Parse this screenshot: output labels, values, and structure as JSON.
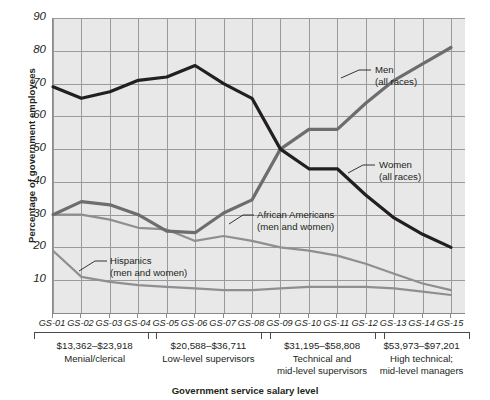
{
  "chart_data": {
    "type": "line",
    "title": "",
    "xlabel": "Government service salary level",
    "ylabel": "Percentage of government employees",
    "ylim": [
      0,
      90
    ],
    "yticks": [
      10,
      20,
      30,
      40,
      50,
      60,
      70,
      80,
      90
    ],
    "grid": true,
    "legend_position": "inline-annotations",
    "categories": [
      "GS-01",
      "GS-02",
      "GS-03",
      "GS-04",
      "GS-05",
      "GS-06",
      "GS-07",
      "GS-08",
      "GS-09",
      "GS-10",
      "GS-11",
      "GS-12",
      "GS-13",
      "GS-14",
      "GS-15"
    ],
    "series": [
      {
        "name": "Women (all races)",
        "color": "#231f20",
        "values": [
          69,
          65.5,
          67.5,
          71,
          72,
          75.5,
          70,
          65.5,
          50,
          44,
          44,
          36,
          29,
          24,
          20
        ]
      },
      {
        "name": "Men (all races)",
        "color": "#6d6d6d",
        "values": [
          30,
          34,
          33,
          30,
          25,
          24.5,
          30.5,
          34.5,
          50,
          56,
          56,
          64,
          71,
          76,
          81
        ]
      },
      {
        "name": "African Americans (men and women)",
        "color": "#8f8f8f",
        "values": [
          30,
          30,
          28.5,
          26,
          25.5,
          22,
          23.5,
          22,
          20,
          19,
          17.5,
          15,
          12,
          9,
          7
        ]
      },
      {
        "name": "Hispanics (men and women)",
        "color": "#8f8f8f",
        "values": [
          19,
          11,
          9.5,
          8.5,
          8,
          7.5,
          7,
          7,
          7.5,
          8,
          8,
          8,
          7.5,
          6.5,
          5.5
        ]
      }
    ],
    "annotations": [
      {
        "label_line1": "Men",
        "label_line2": "(all races)"
      },
      {
        "label_line1": "Women",
        "label_line2": "(all races)"
      },
      {
        "label_line1": "African Americans",
        "label_line2": "(men and women)"
      },
      {
        "label_line1": "Hispanics",
        "label_line2": "(men and women)"
      }
    ],
    "salary_groups": [
      {
        "range": "$13,362–$23,918",
        "role_line1": "Menial/clerical",
        "role_line2": "",
        "levels": [
          "GS-01",
          "GS-02",
          "GS-03",
          "GS-04"
        ]
      },
      {
        "range": "$20,588–$36,711",
        "role_line1": "Low-level supervisors",
        "role_line2": "",
        "levels": [
          "GS-05",
          "GS-06",
          "GS-07",
          "GS-08"
        ]
      },
      {
        "range": "$31,195–$58,808",
        "role_line1": "Technical and",
        "role_line2": "mid-level supervisors",
        "levels": [
          "GS-09",
          "GS-10",
          "GS-11",
          "GS-12"
        ]
      },
      {
        "range": "$53,973–$97,201",
        "role_line1": "High technical;",
        "role_line2": "mid-level managers",
        "levels": [
          "GS-13",
          "GS-14",
          "GS-15"
        ]
      }
    ]
  },
  "axis": {
    "y_title": "Percentage of government employees",
    "x_title": "Government service salary level",
    "y_labels": [
      "90",
      "80",
      "70",
      "60",
      "50",
      "40",
      "30",
      "20",
      "10"
    ],
    "x_labels": [
      "GS-01",
      "GS-02",
      "GS-03",
      "GS-04",
      "GS-05",
      "GS-06",
      "GS-07",
      "GS-08",
      "GS-09",
      "GS-10",
      "GS-11",
      "GS-12",
      "GS-13",
      "GS-14",
      "GS-15"
    ]
  },
  "annotations": {
    "men_l1": "Men",
    "men_l2": "(all races)",
    "women_l1": "Women",
    "women_l2": "(all races)",
    "african_l1": "African Americans",
    "african_l2": "(men and women)",
    "hispanic_l1": "Hispanics",
    "hispanic_l2": "(men and women)"
  },
  "groups": [
    {
      "range": "$13,362–$23,918",
      "l1": "Menial/clerical",
      "l2": ""
    },
    {
      "range": "$20,588–$36,711",
      "l1": "Low-level supervisors",
      "l2": ""
    },
    {
      "range": "$31,195–$58,808",
      "l1": "Technical and",
      "l2": "mid-level supervisors"
    },
    {
      "range": "$53,973–$97,201",
      "l1": "High technical;",
      "l2": "mid-level managers"
    }
  ],
  "colors": {
    "plot_bg": "#e8e8e8",
    "grid": "#9a9a9a",
    "women": "#231f20",
    "men": "#6d6d6d",
    "african_americans": "#8f8f8f",
    "hispanics": "#8f8f8f"
  }
}
